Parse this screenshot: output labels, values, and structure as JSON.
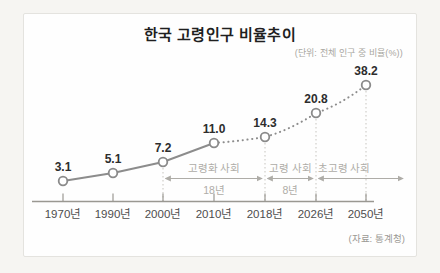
{
  "chart": {
    "title": "한국 고령인구 비율추이",
    "unit_label": "(단위: 전체 인구 중 비율(%))",
    "source_label": "(자료: 통계청)"
  },
  "chart_data": {
    "type": "line",
    "title": "한국 고령인구 비율추이",
    "unit": "전체 인구 중 비율(%)",
    "source": "통계청",
    "categories": [
      "1970년",
      "1990년",
      "2000년",
      "2010년",
      "2018년",
      "2026년",
      "2050년"
    ],
    "values": [
      3.1,
      5.1,
      7.2,
      11.0,
      14.3,
      20.8,
      38.2
    ],
    "value_labels": [
      "3.1",
      "5.1",
      "7.2",
      "11.0",
      "14.3",
      "20.8",
      "38.2"
    ],
    "line_style": {
      "solid_through": "2010년",
      "dotted_after": "2010년"
    },
    "guide_years": [
      "2000년",
      "2018년",
      "2026년",
      "2050년"
    ],
    "phases": [
      {
        "label": "고령화 사회",
        "duration": "18년",
        "from": "2000년",
        "to": "2018년"
      },
      {
        "label": "고령 사회",
        "duration": "8년",
        "from": "2018년",
        "to": "2026년"
      },
      {
        "label": "초고령 사회",
        "duration": null,
        "from": "2026년",
        "to": null
      }
    ],
    "legend": null,
    "grid": false,
    "xlabel": "",
    "ylabel": "",
    "colors": {
      "trend_line": "#8c8c8c",
      "marker_fill": "#ffffff",
      "marker_stroke": "#8a8a8a",
      "value_label": "#2d2d2d",
      "annotation": "#aeaca7",
      "axis": "#9a9892",
      "year_label": "#4d4d4d"
    }
  }
}
